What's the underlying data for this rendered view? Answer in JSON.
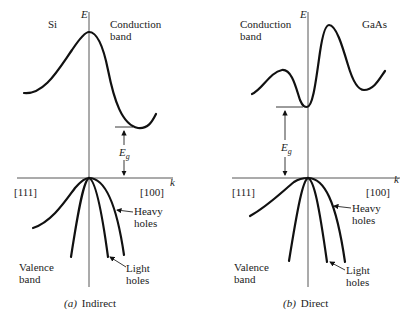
{
  "panels": [
    {
      "id": "a",
      "material": "Si",
      "axis_energy": "E",
      "axis_k": "k",
      "conduction_label": [
        "Conduction",
        "band"
      ],
      "valence_label": [
        "Valence",
        "band"
      ],
      "direction_left": "[111]",
      "direction_right": "[100]",
      "gap_label": "E",
      "gap_subscript": "g",
      "heavy_label": [
        "Heavy",
        "holes"
      ],
      "light_label": [
        "Light",
        "holes"
      ],
      "caption_letter": "(a)",
      "caption_text": "Indirect"
    },
    {
      "id": "b",
      "material": "GaAs",
      "axis_energy": "E",
      "axis_k": "k",
      "conduction_label": [
        "Conduction",
        "band"
      ],
      "valence_label": [
        "Valence",
        "band"
      ],
      "direction_left": "[111]",
      "direction_right": "[100]",
      "gap_label": "E",
      "gap_subscript": "g",
      "heavy_label": [
        "Heavy",
        "holes"
      ],
      "light_label": [
        "Light",
        "holes"
      ],
      "caption_letter": "(b)",
      "caption_text": "Direct"
    }
  ]
}
